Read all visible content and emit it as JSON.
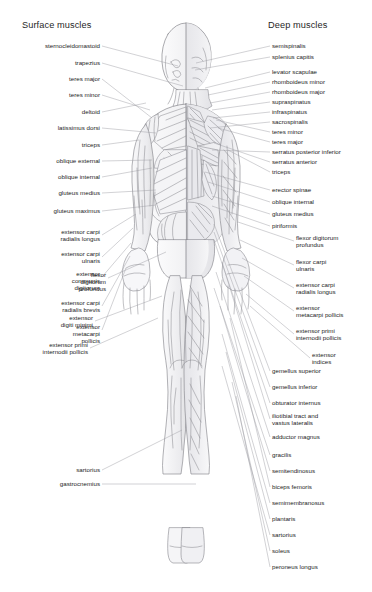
{
  "figure": {
    "title_left": "Surface muscles",
    "title_right": "Deep muscles",
    "view": "posterior",
    "ink_color": "#6e6e72",
    "text_color": "#1c1c1c",
    "leader_color": "#8a8a90",
    "background": "#ffffff"
  },
  "left_labels": [
    {
      "text": "sternocleidomastoid",
      "x": 100,
      "y": 46,
      "tx": 178,
      "ty": 66
    },
    {
      "text": "trapezius",
      "x": 100,
      "y": 63,
      "tx": 183,
      "ty": 86
    },
    {
      "text": "teres major",
      "x": 100,
      "y": 79,
      "tx": 152,
      "ty": 118
    },
    {
      "text": "teres minor",
      "x": 100,
      "y": 95,
      "tx": 150,
      "ty": 110
    },
    {
      "text": "deltoid",
      "x": 100,
      "y": 112,
      "tx": 146,
      "ty": 103
    },
    {
      "text": "latissimus dorsi",
      "x": 100,
      "y": 128,
      "tx": 156,
      "ty": 133
    },
    {
      "text": "triceps",
      "x": 100,
      "y": 145,
      "tx": 139,
      "ty": 140
    },
    {
      "text": "oblique external",
      "x": 100,
      "y": 161,
      "tx": 152,
      "ty": 160
    },
    {
      "text": "oblique internal",
      "x": 100,
      "y": 177,
      "tx": 152,
      "ty": 168
    },
    {
      "text": "gluteus medius",
      "x": 100,
      "y": 193,
      "tx": 156,
      "ty": 190
    },
    {
      "text": "gluteus maximus",
      "x": 100,
      "y": 211,
      "tx": 156,
      "ty": 205
    },
    {
      "text": "extensor carpi\nradialis longus",
      "x": 100,
      "y": 232,
      "tx": 136,
      "ty": 214
    },
    {
      "text": "extensor carpi\nulnaris",
      "x": 100,
      "y": 254,
      "tx": 133,
      "ty": 228
    },
    {
      "text": "extensor\ncommunis\ndigitorum",
      "x": 100,
      "y": 274,
      "tx": 131,
      "ty": 243
    },
    {
      "text": "extensor carpi\nradialis brevis",
      "x": 100,
      "y": 303,
      "tx": 130,
      "ty": 256
    },
    {
      "text": "extensor\nmetacarpi\npollicis",
      "x": 100,
      "y": 327,
      "tx": 126,
      "ty": 268
    },
    {
      "text": "sartorius",
      "x": 100,
      "y": 470,
      "tx": 182,
      "ty": 430
    },
    {
      "text": "gastrocnemius",
      "x": 100,
      "y": 484,
      "tx": 196,
      "ty": 484
    }
  ],
  "center_labels": [
    {
      "text": "flexor\ndigitorum\nprofundus",
      "x": 106,
      "y": 275,
      "tx": 166,
      "ty": 252
    },
    {
      "text": "extensor\ndigiti minimi",
      "x": 93,
      "y": 318,
      "tx": 162,
      "ty": 296
    },
    {
      "text": "extensor primi\ninternodii pollicis",
      "x": 88,
      "y": 345,
      "tx": 158,
      "ty": 318
    }
  ],
  "right_labels": [
    {
      "text": "semispinalis",
      "x": 272,
      "y": 46,
      "tx": 196,
      "ty": 63
    },
    {
      "text": "splenius capitis",
      "x": 272,
      "y": 57,
      "tx": 195,
      "ty": 70
    },
    {
      "text": "levator scapulae",
      "x": 272,
      "y": 72,
      "tx": 205,
      "ty": 88
    },
    {
      "text": "rhomboideus minor",
      "x": 272,
      "y": 82,
      "tx": 208,
      "ty": 95
    },
    {
      "text": "rhomboideus major",
      "x": 272,
      "y": 92,
      "tx": 210,
      "ty": 103
    },
    {
      "text": "supraspinatus",
      "x": 272,
      "y": 102,
      "tx": 212,
      "ty": 110
    },
    {
      "text": "infraspinatus",
      "x": 272,
      "y": 112,
      "tx": 213,
      "ty": 118
    },
    {
      "text": "sacrospinalis",
      "x": 272,
      "y": 122,
      "tx": 210,
      "ty": 128
    },
    {
      "text": "teres minor",
      "x": 272,
      "y": 132,
      "tx": 216,
      "ty": 120
    },
    {
      "text": "teres major",
      "x": 272,
      "y": 142,
      "tx": 218,
      "ty": 128
    },
    {
      "text": "serratus posterior inferior",
      "x": 272,
      "y": 152,
      "tx": 212,
      "ty": 150
    },
    {
      "text": "serratus anterior",
      "x": 272,
      "y": 162,
      "tx": 214,
      "ty": 143
    },
    {
      "text": "triceps",
      "x": 272,
      "y": 172,
      "tx": 228,
      "ty": 150
    },
    {
      "text": "erector spinae",
      "x": 272,
      "y": 190,
      "tx": 205,
      "ty": 172
    },
    {
      "text": "oblique internal",
      "x": 272,
      "y": 202,
      "tx": 208,
      "ty": 182
    },
    {
      "text": "gluteus medius",
      "x": 272,
      "y": 214,
      "tx": 212,
      "ty": 196
    },
    {
      "text": "piriformis",
      "x": 272,
      "y": 226,
      "tx": 212,
      "ty": 206
    },
    {
      "text": "flexor digitorum\nprofundus",
      "x": 296,
      "y": 238,
      "tx": 238,
      "ty": 222
    },
    {
      "text": "flexor carpi\nulnaris",
      "x": 296,
      "y": 262,
      "tx": 240,
      "ty": 240
    },
    {
      "text": "extensor carpi\nradialis longus",
      "x": 296,
      "y": 285,
      "tx": 242,
      "ty": 258
    },
    {
      "text": "extensor\nmetacarpi pollicis",
      "x": 296,
      "y": 308,
      "tx": 244,
      "ty": 276
    },
    {
      "text": "extensor primi\ninternodii pollicis",
      "x": 296,
      "y": 331,
      "tx": 246,
      "ty": 294
    },
    {
      "text": "extensor\nindices",
      "x": 312,
      "y": 355,
      "tx": 250,
      "ty": 306
    },
    {
      "text": "gemellus superior",
      "x": 272,
      "y": 371,
      "tx": 214,
      "ty": 224
    },
    {
      "text": "gemellus inferior",
      "x": 272,
      "y": 387,
      "tx": 214,
      "ty": 232
    },
    {
      "text": "obturator internus",
      "x": 272,
      "y": 403,
      "tx": 214,
      "ty": 240
    },
    {
      "text": "iliotibial tract and\nvastus lateralis",
      "x": 272,
      "y": 416,
      "tx": 222,
      "ty": 262
    },
    {
      "text": "adductor magnus",
      "x": 272,
      "y": 437,
      "tx": 216,
      "ty": 272
    },
    {
      "text": "gracilis",
      "x": 272,
      "y": 455,
      "tx": 214,
      "ty": 288
    },
    {
      "text": "semitendinosus",
      "x": 272,
      "y": 471,
      "tx": 220,
      "ty": 306
    },
    {
      "text": "biceps femoris",
      "x": 272,
      "y": 487,
      "tx": 230,
      "ty": 318
    },
    {
      "text": "semimembranosus",
      "x": 272,
      "y": 503,
      "tx": 222,
      "ty": 334
    },
    {
      "text": "plantaris",
      "x": 272,
      "y": 519,
      "tx": 226,
      "ty": 352
    },
    {
      "text": "sartorius",
      "x": 272,
      "y": 535,
      "tx": 222,
      "ty": 366
    },
    {
      "text": "soleus",
      "x": 272,
      "y": 551,
      "tx": 232,
      "ty": 382
    },
    {
      "text": "peroneus longus",
      "x": 272,
      "y": 567,
      "tx": 236,
      "ty": 396
    }
  ]
}
